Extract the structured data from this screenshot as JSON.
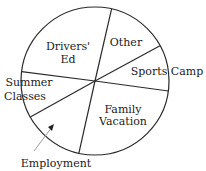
{
  "chart_data": {
    "type": "pie",
    "title": "",
    "slices": [
      {
        "label": "Other",
        "lines": [
          "Other"
        ],
        "value": 13,
        "start_deg": 28.5,
        "end_deg": 77
      },
      {
        "label": "Drivers' Ed",
        "lines": [
          "Drivers'",
          "Ed"
        ],
        "value": 27,
        "start_deg": 77,
        "end_deg": 172.8
      },
      {
        "label": "Summer Classes",
        "lines": [
          "Summer",
          "Classes"
        ],
        "value": 10,
        "start_deg": 172.8,
        "end_deg": 209
      },
      {
        "label": "Employment",
        "lines": [
          "Employment"
        ],
        "value": 13,
        "start_deg": 209,
        "end_deg": 257.4
      },
      {
        "label": "Family Vacation",
        "lines": [
          "Family",
          "Vacation"
        ],
        "value": 26,
        "start_deg": 257.4,
        "end_deg": 352.2
      },
      {
        "label": "Sports Camp",
        "lines": [
          "Sports Camp"
        ],
        "value": 10,
        "start_deg": -7.8,
        "end_deg": 28.5
      }
    ],
    "unit": "percent (estimated from angles, unlabeled)",
    "legend": "none (direct labels)",
    "fill": "#ffffff",
    "stroke": "#2a2a2a"
  },
  "labels": {
    "drivers_ed_1": "Drivers'",
    "drivers_ed_2": "Ed",
    "other": "Other",
    "sports_camp": "Sports Camp",
    "summer_1": "Summer",
    "summer_2": "Classes",
    "family_1": "Family",
    "family_2": "Vacation",
    "employment": "Employment"
  }
}
